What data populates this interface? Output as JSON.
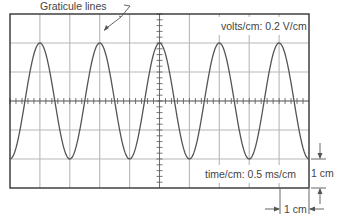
{
  "figure": {
    "callout_label": "Graticule lines",
    "volts_label": "volts/cm: 0.2 V/cm",
    "time_label": "time/cm: 0.5 ms/cm",
    "vertical_scale_label": "1 cm",
    "horizontal_scale_label": "1 cm"
  },
  "graticule": {
    "divisions_x": 10,
    "divisions_y": 6,
    "left": 10,
    "top": 14,
    "right": 309,
    "bottom": 188,
    "minor_ticks_per_division": 5,
    "grid_color": "#b8b8b8",
    "border_color": "#333333"
  },
  "waveform": {
    "type": "sine",
    "cycles": 5,
    "amplitude_divisions": 2,
    "peak_to_peak_divisions": 4,
    "first_peak_x_division": 1,
    "color": "#555555"
  }
}
